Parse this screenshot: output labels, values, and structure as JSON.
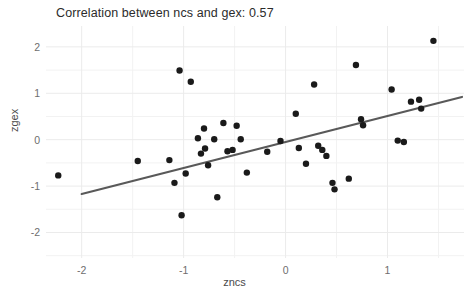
{
  "chart_data": {
    "type": "scatter",
    "title": "Correlation between ncs and gex: 0.57",
    "xlabel": "zncs",
    "ylabel": "zgex",
    "xlim": [
      -2.35,
      1.75
    ],
    "ylim": [
      -2.55,
      2.45
    ],
    "xticks": [
      -2,
      -1,
      0,
      1
    ],
    "xtick_labels": [
      "-2",
      "-1",
      "0",
      "1"
    ],
    "yticks": [
      -2,
      -1,
      0,
      1,
      2
    ],
    "ytick_labels": [
      "-2",
      "-1",
      "0",
      "1",
      "2"
    ],
    "grid": true,
    "minor_grid": true,
    "legend": null,
    "correlation": 0.57,
    "point_color": "#1a1a1a",
    "point_size": 3.2,
    "grid_color": "#ebebeb",
    "panel_color": "#ffffff",
    "trendline": {
      "type": "linear",
      "color": "#595959",
      "width": 2.2,
      "x_start": -2.0,
      "y_start": -1.17,
      "x_end": 1.73,
      "y_end": 0.92
    },
    "points": [
      {
        "x": -2.23,
        "y": -0.77
      },
      {
        "x": -1.45,
        "y": -0.46
      },
      {
        "x": -1.14,
        "y": -0.44
      },
      {
        "x": -1.09,
        "y": -0.93
      },
      {
        "x": -1.04,
        "y": 1.49
      },
      {
        "x": -1.02,
        "y": -1.63
      },
      {
        "x": -0.98,
        "y": -0.73
      },
      {
        "x": -0.93,
        "y": 1.25
      },
      {
        "x": -0.86,
        "y": 0.03
      },
      {
        "x": -0.83,
        "y": -0.3
      },
      {
        "x": -0.8,
        "y": 0.24
      },
      {
        "x": -0.79,
        "y": -0.19
      },
      {
        "x": -0.76,
        "y": -0.55
      },
      {
        "x": -0.7,
        "y": 0.01
      },
      {
        "x": -0.67,
        "y": -1.24
      },
      {
        "x": -0.61,
        "y": 0.36
      },
      {
        "x": -0.57,
        "y": -0.25
      },
      {
        "x": -0.52,
        "y": -0.22
      },
      {
        "x": -0.48,
        "y": 0.3
      },
      {
        "x": -0.44,
        "y": 0.01
      },
      {
        "x": -0.38,
        "y": -0.71
      },
      {
        "x": -0.18,
        "y": -0.26
      },
      {
        "x": -0.05,
        "y": -0.03
      },
      {
        "x": 0.1,
        "y": 0.56
      },
      {
        "x": 0.13,
        "y": -0.18
      },
      {
        "x": 0.2,
        "y": -0.52
      },
      {
        "x": 0.28,
        "y": 1.19
      },
      {
        "x": 0.32,
        "y": -0.13
      },
      {
        "x": 0.36,
        "y": -0.22
      },
      {
        "x": 0.4,
        "y": -0.35
      },
      {
        "x": 0.46,
        "y": -0.93
      },
      {
        "x": 0.48,
        "y": -1.07
      },
      {
        "x": 0.62,
        "y": -0.84
      },
      {
        "x": 0.69,
        "y": 1.61
      },
      {
        "x": 0.74,
        "y": 0.44
      },
      {
        "x": 0.76,
        "y": 0.31
      },
      {
        "x": 1.04,
        "y": 1.08
      },
      {
        "x": 1.1,
        "y": -0.02
      },
      {
        "x": 1.16,
        "y": -0.05
      },
      {
        "x": 1.23,
        "y": 0.82
      },
      {
        "x": 1.31,
        "y": 0.86
      },
      {
        "x": 1.33,
        "y": 0.67
      },
      {
        "x": 1.45,
        "y": 2.13
      }
    ]
  }
}
